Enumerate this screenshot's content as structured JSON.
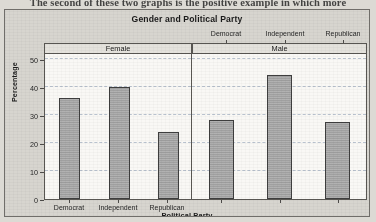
{
  "page": {
    "caption_line": "The second of these two graphs is the positive example in which more"
  },
  "chart": {
    "title": "Gender and Political Party",
    "xlabel": "Political Party",
    "ylabel": "Percentage",
    "panels": [
      {
        "label": "Female"
      },
      {
        "label": "Male"
      }
    ],
    "tick_labels": [
      "Democrat",
      "Independent",
      "Republican"
    ],
    "y_ticks": [
      "0",
      "10",
      "20",
      "30",
      "40",
      "50"
    ]
  },
  "chart_data": {
    "type": "bar",
    "title": "Gender and Political Party",
    "xlabel": "Political Party",
    "ylabel": "Percentage",
    "ylim": [
      0,
      52
    ],
    "yticks": [
      0,
      10,
      20,
      30,
      40,
      50
    ],
    "grid": true,
    "legend": "none",
    "panel_variable": "Gender",
    "categories": [
      "Democrat",
      "Independent",
      "Republican"
    ],
    "series": [
      {
        "name": "Female",
        "values": [
          36,
          40,
          24
        ]
      },
      {
        "name": "Male",
        "values": [
          28,
          44,
          27.5
        ]
      }
    ]
  }
}
